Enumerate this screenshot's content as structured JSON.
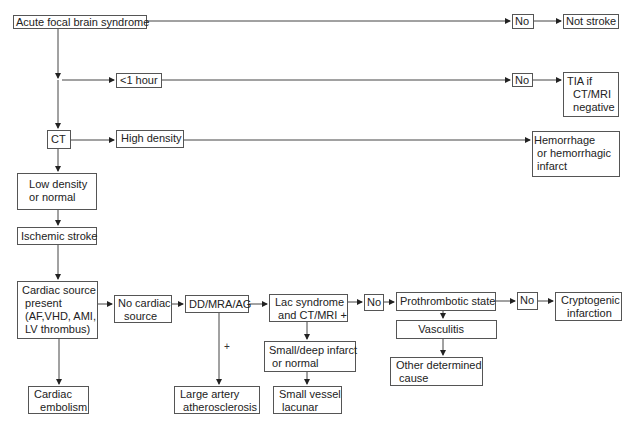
{
  "diagram": {
    "type": "flowchart",
    "nodes": {
      "acute": "Acute focal brain syndrome",
      "no1": "No",
      "not_stroke": "Not stroke",
      "lt1h": "<1 hour",
      "no2": "No",
      "tia": "TIA if\n  CT/MRI\n  negative",
      "ct": "CT",
      "high_density": "High density",
      "hemorrhage": "Hemorrhage\n or hemorrhagic\n infarct",
      "low_density": " Low density\n or normal",
      "ischemic": "Ischemic stroke",
      "cardiac_source": "Cardiac source\n present\n (AF,VHD, AMI,\n LV thrombus)",
      "no_cardiac": "No cardiac\n  source",
      "dd": "DD/MRA/AG",
      "lac": "Lac syndrome\n and CT/MRI +",
      "no3": "No",
      "prothrombotic": "Prothrombotic state",
      "no4": "No",
      "cryptogenic": "Cryptogenic\n  infarction",
      "vasculitis": "      Vasculitis",
      "other_cause": "Other determined\n cause",
      "small_deep": "Small/deep infarct\n or normal",
      "small_vessel": "Small vessel\n lacunar",
      "large_artery": "Large artery\n atherosclerosis",
      "cardiac_embolism": "Cardiac\n  embolism"
    },
    "edge_labels": {
      "dd_to_large_artery": "+"
    }
  }
}
